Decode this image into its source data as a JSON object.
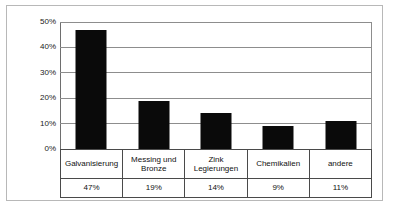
{
  "chart_data": {
    "type": "bar",
    "title": "",
    "xlabel": "",
    "ylabel": "",
    "categories": [
      "Galvanisierung",
      "Messing und Bronze",
      "Zink Legierungen",
      "Chemikalien",
      "andere"
    ],
    "values": [
      47,
      19,
      14,
      9,
      11
    ],
    "value_labels": [
      "47%",
      "19%",
      "14%",
      "9%",
      "11%"
    ],
    "ylim": [
      0,
      50
    ],
    "ytick_values": [
      0,
      10,
      20,
      30,
      40,
      50
    ],
    "ytick_labels": [
      "0%",
      "10%",
      "20%",
      "30%",
      "40%",
      "50%"
    ],
    "grid": true,
    "legend": false,
    "bar_color": "#0a0a0a",
    "gridline_color": "#8d8d8d",
    "axis_color": "#6e6e6e",
    "frame_color": "#b8b8b8",
    "table_border_color": "#4a4a4a"
  },
  "table": {
    "category_row": [
      "Galvanisierung",
      "Messing und\nBronze",
      "Zink\nLegierungen",
      "Chemikalien",
      "andere"
    ],
    "value_row": [
      "47%",
      "19%",
      "14%",
      "9%",
      "11%"
    ]
  }
}
